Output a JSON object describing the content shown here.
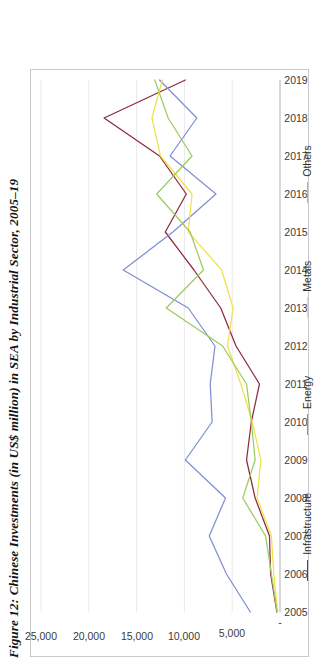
{
  "figure": {
    "caption": "Figure 12: Chinese Investments (in US$ million) in SEA by Industrial Sector, 2005–19"
  },
  "chart_data": {
    "type": "line",
    "title": "Figure 12: Chinese Investments (in US$ million) in SEA by Industrial Sector, 2005–19",
    "xlabel": "",
    "ylabel": "",
    "orientation": "rotated-90-ccw",
    "grid": true,
    "legend_position": "bottom",
    "ylim": [
      0,
      25000
    ],
    "yticks": [
      0,
      5000,
      10000,
      15000,
      20000,
      25000
    ],
    "ytick_labels": [
      "-",
      "5,000",
      "10,000",
      "15,000",
      "20,000",
      "25,000"
    ],
    "categories": [
      "2005",
      "2006",
      "2007",
      "2008",
      "2009",
      "2010",
      "2011",
      "2012",
      "2013",
      "2014",
      "2015",
      "2016",
      "2017",
      "2018",
      "2019"
    ],
    "series": [
      {
        "name": "Infrastructure",
        "color": "#8c2b3e",
        "values": [
          330,
          980,
          1100,
          2600,
          3500,
          3000,
          2150,
          4600,
          6200,
          9000,
          12000,
          9800,
          12600,
          18400,
          9900
        ]
      },
      {
        "name": "Energy",
        "color": "#7f8fd4",
        "values": [
          3100,
          5600,
          7400,
          5700,
          9900,
          7100,
          7300,
          6800,
          9600,
          16400,
          11200,
          6700,
          11500,
          8700,
          12600
        ]
      },
      {
        "name": "Metals",
        "color": "#f2e04a",
        "values": [
          250,
          650,
          900,
          2400,
          2000,
          2900,
          4100,
          5500,
          4900,
          6100,
          9600,
          9200,
          12500,
          13400,
          12300
        ]
      },
      {
        "name": "Others",
        "color": "#9ccb61",
        "values": [
          300,
          900,
          1500,
          3900,
          2600,
          3000,
          3500,
          6000,
          11900,
          8000,
          9400,
          12900,
          9200,
          11700,
          13100
        ]
      }
    ]
  },
  "legend": {
    "items": [
      {
        "label": "Infrastructure",
        "color": "#8c2b3e"
      },
      {
        "label": "Energy",
        "color": "#7f8fd4"
      },
      {
        "label": "Metals",
        "color": "#f2e04a"
      },
      {
        "label": "Others",
        "color": "#9ccb61"
      }
    ]
  }
}
